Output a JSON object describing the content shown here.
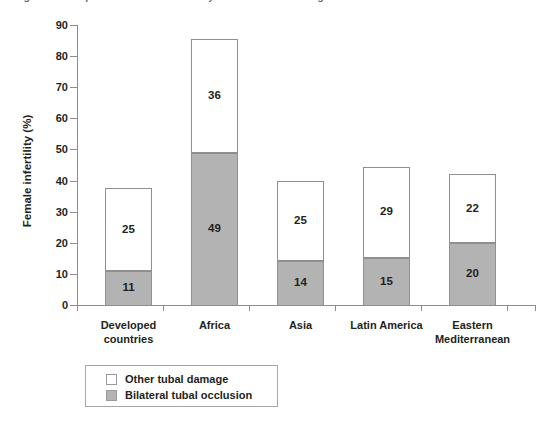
{
  "figure": {
    "title_clipped": "Figure 1. Comparison of tubal infertility in different world regions",
    "background": "#ffffff"
  },
  "chart_data": {
    "type": "bar",
    "stacked": true,
    "title": "",
    "xlabel": "",
    "ylabel": "Female infertility (%)",
    "ylim": [
      0,
      90
    ],
    "ytick_values": [
      0,
      10,
      20,
      30,
      40,
      50,
      60,
      70,
      80,
      90
    ],
    "ytick_labels": [
      "0",
      "10",
      "20",
      "30",
      "40",
      "50",
      "60",
      "70",
      "80",
      "90"
    ],
    "grid": false,
    "legend_position": "bottom-left",
    "categories": [
      "Developed countries",
      "Africa",
      "Asia",
      "Latin America",
      "Eastern Mediterranean"
    ],
    "category_lines": [
      [
        "Developed",
        "countries"
      ],
      [
        "Africa"
      ],
      [
        "Asia"
      ],
      [
        "Latin America"
      ],
      [
        "Eastern",
        "Mediterranean"
      ]
    ],
    "series": [
      {
        "name": "Bilateral tubal occlusion",
        "color": "#b3b3b3",
        "values": [
          11,
          49,
          14,
          15,
          20
        ],
        "labels": [
          "11",
          "49",
          "14",
          "15",
          "20"
        ]
      },
      {
        "name": "Other tubal damage",
        "color": "#ffffff",
        "values": [
          26.5,
          36.5,
          26,
          29.5,
          22
        ],
        "labels": [
          "25",
          "36",
          "25",
          "29",
          "22"
        ]
      }
    ],
    "bar_totals": [
      37.5,
      85.5,
      40,
      44.5,
      42
    ]
  },
  "legend": {
    "items": [
      {
        "label": "Other tubal damage",
        "swatch": "white"
      },
      {
        "label": "Bilateral tubal occlusion",
        "swatch": "gray"
      }
    ]
  },
  "axis": {
    "tick_color": "#8c8c8c",
    "text_color": "#231f20"
  }
}
